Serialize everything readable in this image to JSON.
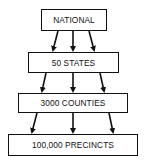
{
  "diagram": {
    "type": "hierarchy",
    "levels": [
      {
        "label": "NATIONAL"
      },
      {
        "label": "50 STATES"
      },
      {
        "label": "3000 COUNTIES"
      },
      {
        "label": "100,000 PRECINCTS"
      }
    ],
    "arrows_per_link": 3
  }
}
